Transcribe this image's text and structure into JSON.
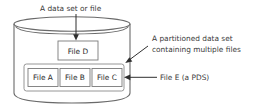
{
  "diagram": {
    "type": "concept-diagram",
    "colors": {
      "background": "#ffffff",
      "cylinder_stroke": "#6a6a6a",
      "box_stroke": "#7a7a7a",
      "pds_stroke": "#8a8a8a",
      "arrow": "#2f2f2f",
      "text": "#3a3a3a",
      "box_text": "#2b2b2b"
    },
    "cylinder": {
      "name": "storage-volume"
    },
    "annotations": [
      {
        "id": "top-label",
        "text": "A data set or file",
        "lines": [
          "A data set or file"
        ],
        "points_to": "file-d-box"
      },
      {
        "id": "pds-label",
        "text": "A partitioned data set containing multiple files",
        "lines": [
          "A partitioned data set",
          "containing multiple files"
        ],
        "points_to": "pds-container"
      },
      {
        "id": "file-e-label",
        "text": "File E (a PDS)",
        "lines": [
          "File E (a PDS)"
        ],
        "points_to": "pds-container"
      }
    ],
    "boxes": [
      {
        "id": "file-d",
        "label": "File D"
      },
      {
        "id": "file-a",
        "label": "File A"
      },
      {
        "id": "file-b",
        "label": "File B"
      },
      {
        "id": "file-c",
        "label": "File C"
      }
    ]
  }
}
